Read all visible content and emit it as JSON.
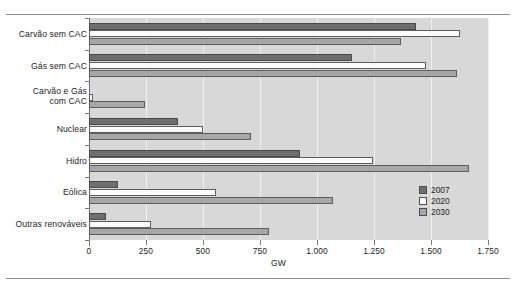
{
  "chart_data": {
    "type": "bar",
    "orientation": "horizontal",
    "title": "",
    "xlabel": "GW",
    "ylabel": "",
    "xlim": [
      0,
      1750
    ],
    "xticks": [
      0,
      250,
      500,
      750,
      1000,
      1250,
      1500,
      1750
    ],
    "xticklabels": [
      "0",
      "250",
      "500",
      "750",
      "1.000",
      "1.250",
      "1.500",
      "1.750"
    ],
    "grid": true,
    "legend_position": "right-inside",
    "categories": [
      "Carvão sem CAC",
      "Gás sem CAC",
      "Carvão e Gás\ncom CAC",
      "Nuclear",
      "Hidro",
      "Eólica",
      "Outras renováveis"
    ],
    "series": [
      {
        "name": "2007",
        "color": "#6e6e6e",
        "values": [
          1435,
          1155,
          0,
          390,
          925,
          125,
          75
        ]
      },
      {
        "name": "2020",
        "color": "#fbfbfb",
        "values": [
          1625,
          1480,
          18,
          500,
          1245,
          555,
          270
        ]
      },
      {
        "name": "2030",
        "color": "#a7a7a7",
        "values": [
          1370,
          1615,
          245,
          710,
          1665,
          1070,
          790
        ]
      }
    ]
  },
  "legend": {
    "items": [
      {
        "label": "2007",
        "swatch": "y2007"
      },
      {
        "label": "2020",
        "swatch": "y2020"
      },
      {
        "label": "2030",
        "swatch": "y2030"
      }
    ]
  },
  "axis": {
    "x_title": "GW"
  },
  "colors": {
    "plot_background": "#d8d8d8",
    "gridline": "#f2f2f2",
    "axis": "#6f6f6f",
    "series_2007": "#6e6e6e",
    "series_2020": "#fbfbfb",
    "series_2030": "#a7a7a7",
    "text": "#1d1d1d"
  }
}
